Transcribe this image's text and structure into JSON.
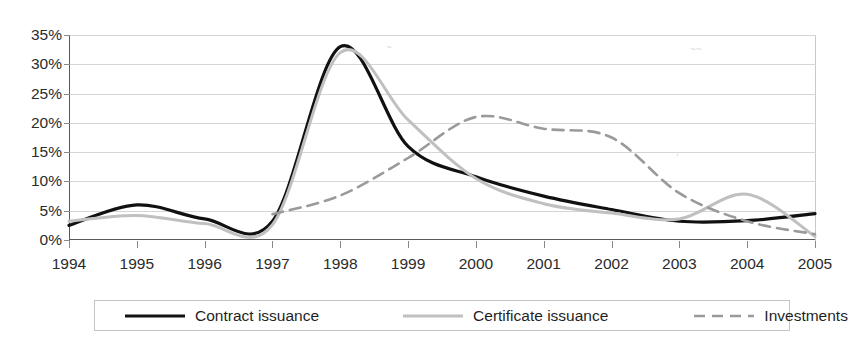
{
  "title_remnant": "",
  "chart_data": {
    "type": "line",
    "title": "",
    "subtitle": "",
    "xlabel": "",
    "ylabel": "",
    "x": [
      1994,
      1995,
      1996,
      1997,
      1998,
      1999,
      2000,
      2001,
      2002,
      2003,
      2004,
      2005
    ],
    "categories": [
      "1994",
      "1995",
      "1996",
      "1997",
      "1998",
      "1999",
      "2000",
      "2001",
      "2002",
      "2003",
      "2004",
      "2005"
    ],
    "xlim": [
      1994,
      2005
    ],
    "ylim": [
      0,
      35
    ],
    "yticks": [
      0,
      5,
      10,
      15,
      20,
      25,
      30,
      35
    ],
    "ytick_labels": [
      "0%",
      "5%",
      "10%",
      "15%",
      "20%",
      "25%",
      "30%",
      "35%"
    ],
    "xtick_labels": [
      "1994",
      "1995",
      "1996",
      "1997",
      "1998",
      "1999",
      "2000",
      "2001",
      "2002",
      "2003",
      "2004",
      "2005"
    ],
    "grid": true,
    "grid_axis": "y",
    "legend_position": "bottom",
    "value_suffix": "%",
    "series": [
      {
        "name": "Contract issuance",
        "style": "solid",
        "color": "#111111",
        "width": 3.2,
        "values": [
          2.5,
          6.0,
          3.6,
          3.2,
          33.0,
          16.0,
          10.8,
          7.5,
          5.2,
          3.2,
          3.3,
          4.5
        ]
      },
      {
        "name": "Certificate issuance",
        "style": "solid",
        "color": "#c0c0c0",
        "width": 3.0,
        "values": [
          3.2,
          4.2,
          2.8,
          2.6,
          32.0,
          20.5,
          10.5,
          6.2,
          4.6,
          3.6,
          7.8,
          0.6
        ]
      },
      {
        "name": "Investments",
        "style": "dashed",
        "color": "#9a9a9a",
        "width": 2.6,
        "values": [
          null,
          null,
          null,
          4.4,
          7.6,
          14.0,
          21.0,
          19.0,
          17.5,
          8.0,
          3.2,
          1.0
        ]
      }
    ]
  },
  "legend": {
    "items": [
      {
        "label": "Contract issuance",
        "swatch": "solid-black-line"
      },
      {
        "label": "Certificate issuance",
        "swatch": "solid-gray-line"
      },
      {
        "label": "Investments",
        "swatch": "dashed-gray-line"
      }
    ]
  },
  "colors": {
    "contract": "#111111",
    "certificate": "#c0c0c0",
    "investments": "#9a9a9a",
    "axis": "#595959",
    "grid": "#d6d6d6",
    "text": "#2b2b2b",
    "legend_border": "#c4c4c4",
    "background": "#ffffff"
  }
}
